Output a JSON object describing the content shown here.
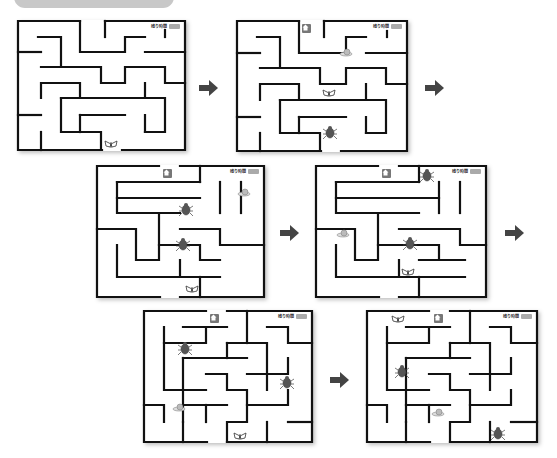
{
  "banner": {
    "text": ""
  },
  "colors": {
    "wall": "#111111",
    "arrow": "#444444",
    "home_bg": "#777777",
    "timer_box": "#aaaaaa",
    "banner_bg": "#c8c8c8"
  },
  "timer": {
    "label": "残り時間",
    "value": ""
  },
  "icons": {
    "home": "home-icon",
    "arrow": "arrow-right-icon",
    "butterfly": "butterfly-icon",
    "beetle": "beetle-icon",
    "snail": "snail-icon"
  },
  "panels": [
    {
      "id": 1,
      "has_home": false,
      "sprites": [
        "butterfly"
      ]
    },
    {
      "id": 2,
      "has_home": true,
      "sprites": [
        "snail",
        "butterfly",
        "beetle"
      ]
    },
    {
      "id": 3,
      "has_home": true,
      "sprites": [
        "snail",
        "beetle",
        "beetle",
        "butterfly"
      ]
    },
    {
      "id": 4,
      "has_home": true,
      "sprites": [
        "beetle",
        "snail",
        "beetle",
        "butterfly"
      ]
    },
    {
      "id": 5,
      "has_home": true,
      "sprites": [
        "beetle",
        "beetle",
        "snail",
        "butterfly"
      ]
    },
    {
      "id": 6,
      "has_home": true,
      "sprites": [
        "butterfly",
        "beetle",
        "snail",
        "beetle"
      ]
    }
  ],
  "arrows": [
    {
      "from": 1,
      "to": 2
    },
    {
      "from": 2,
      "to": 3
    },
    {
      "from": 3,
      "to": 4
    },
    {
      "from": 4,
      "to": 5
    },
    {
      "from": 5,
      "to": 6
    }
  ]
}
